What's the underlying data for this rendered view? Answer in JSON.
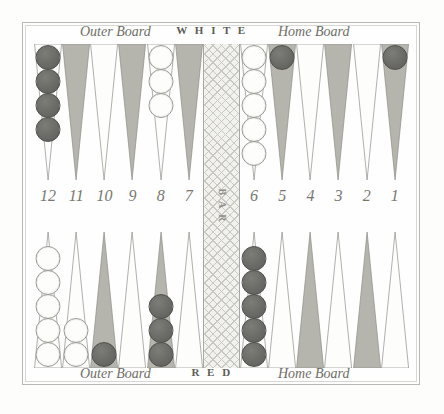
{
  "figure": {
    "bar_label": "B A R"
  },
  "captions": {
    "top": {
      "outer_board": "Outer Board",
      "player": "W H I T E",
      "home_board": "Home Board"
    },
    "bottom": {
      "outer_board": "Outer Board",
      "player": "R E D",
      "home_board": "Home Board"
    }
  },
  "point_numbers": {
    "left": [
      "12",
      "11",
      "10",
      "9",
      "8",
      "7"
    ],
    "right": [
      "6",
      "5",
      "4",
      "3",
      "2",
      "1"
    ]
  },
  "colors": {
    "triangle_shaded": "#b5b5ad",
    "triangle_plain": "#fdfdfc",
    "triangle_outline": "#8e8e88",
    "checker_dark": "#6a6a66",
    "checker_white": "#fdfdfc",
    "frame": "#b9b9b4",
    "bar_fill": "#f1f1ee",
    "text": "#6e6e67"
  },
  "board": {
    "top_points": [
      {
        "number": "12",
        "shaded": false,
        "checkers": 4,
        "color": "dark"
      },
      {
        "number": "11",
        "shaded": true,
        "checkers": 0,
        "color": null
      },
      {
        "number": "10",
        "shaded": false,
        "checkers": 0,
        "color": null
      },
      {
        "number": "9",
        "shaded": true,
        "checkers": 0,
        "color": null
      },
      {
        "number": "8",
        "shaded": false,
        "checkers": 3,
        "color": "white"
      },
      {
        "number": "7",
        "shaded": true,
        "checkers": 0,
        "color": null
      },
      {
        "number": "6",
        "shaded": false,
        "checkers": 5,
        "color": "white"
      },
      {
        "number": "5",
        "shaded": true,
        "checkers": 1,
        "color": "dark"
      },
      {
        "number": "4",
        "shaded": false,
        "checkers": 0,
        "color": null
      },
      {
        "number": "3",
        "shaded": true,
        "checkers": 0,
        "color": null
      },
      {
        "number": "2",
        "shaded": false,
        "checkers": 0,
        "color": null
      },
      {
        "number": "1",
        "shaded": true,
        "checkers": 1,
        "color": "dark"
      }
    ],
    "bottom_points": [
      {
        "number": "12",
        "shaded": false,
        "checkers": 5,
        "color": "white"
      },
      {
        "number": "11",
        "shaded": false,
        "checkers": 2,
        "color": "white"
      },
      {
        "number": "10",
        "shaded": true,
        "checkers": 1,
        "color": "dark"
      },
      {
        "number": "9",
        "shaded": false,
        "checkers": 0,
        "color": null
      },
      {
        "number": "8",
        "shaded": true,
        "checkers": 3,
        "color": "dark"
      },
      {
        "number": "7",
        "shaded": false,
        "checkers": 0,
        "color": null
      },
      {
        "number": "6",
        "shaded": false,
        "checkers": 5,
        "color": "dark"
      },
      {
        "number": "5",
        "shaded": false,
        "checkers": 0,
        "color": null
      },
      {
        "number": "4",
        "shaded": true,
        "checkers": 0,
        "color": null
      },
      {
        "number": "3",
        "shaded": false,
        "checkers": 0,
        "color": null
      },
      {
        "number": "2",
        "shaded": true,
        "checkers": 0,
        "color": null
      },
      {
        "number": "1",
        "shaded": false,
        "checkers": 0,
        "color": null
      }
    ]
  }
}
